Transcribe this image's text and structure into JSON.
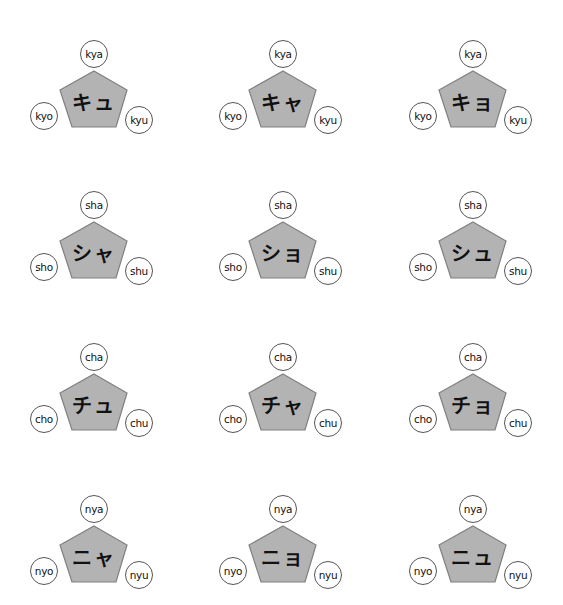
{
  "style": {
    "pentagon_fill": "#b3b3b3",
    "pentagon_stroke": "#808080",
    "bubble_stroke": "#555555",
    "background": "#ffffff"
  },
  "grid": [
    {
      "row": "ky",
      "cells": [
        {
          "kana": "キュ",
          "top": "kya",
          "left": "kyo",
          "right": "kyu"
        },
        {
          "kana": "キャ",
          "top": "kya",
          "left": "kyo",
          "right": "kyu"
        },
        {
          "kana": "キョ",
          "top": "kya",
          "left": "kyo",
          "right": "kyu"
        }
      ]
    },
    {
      "row": "sh",
      "cells": [
        {
          "kana": "シャ",
          "top": "sha",
          "left": "sho",
          "right": "shu"
        },
        {
          "kana": "ショ",
          "top": "sha",
          "left": "sho",
          "right": "shu"
        },
        {
          "kana": "シュ",
          "top": "sha",
          "left": "sho",
          "right": "shu"
        }
      ]
    },
    {
      "row": "ch",
      "cells": [
        {
          "kana": "チュ",
          "top": "cha",
          "left": "cho",
          "right": "chu"
        },
        {
          "kana": "チャ",
          "top": "cha",
          "left": "cho",
          "right": "chu"
        },
        {
          "kana": "チョ",
          "top": "cha",
          "left": "cho",
          "right": "chu"
        }
      ]
    },
    {
      "row": "ny",
      "cells": [
        {
          "kana": "ニャ",
          "top": "nya",
          "left": "nyo",
          "right": "nyu"
        },
        {
          "kana": "ニョ",
          "top": "nya",
          "left": "nyo",
          "right": "nyu"
        },
        {
          "kana": "ニュ",
          "top": "nya",
          "left": "nyo",
          "right": "nyu"
        }
      ]
    }
  ]
}
